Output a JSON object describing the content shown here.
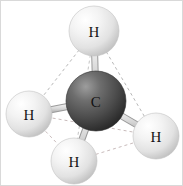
{
  "figure": {
    "background_color": "#ffffff",
    "border_color": "#d9d9d9",
    "width": 183,
    "height": 186
  },
  "molecule": {
    "formula": "CH4",
    "geometry": "tetrahedral",
    "center_atom": {
      "symbol": "C",
      "label": "C",
      "cx": 95,
      "cy": 100,
      "r": 30,
      "color_light": "#8c8c8c",
      "color_mid": "#545454",
      "color_dark": "#2e2e2e",
      "label_color": "#111111"
    },
    "hydrogen_atoms": [
      {
        "id": "h-top",
        "symbol": "H",
        "label": "H",
        "cx": 93,
        "cy": 30,
        "r": 25,
        "color_light": "#ffffff",
        "color_mid": "#ebebeb",
        "color_dark": "#c2c2c2",
        "label_color": "#141414"
      },
      {
        "id": "h-left",
        "symbol": "H",
        "label": "H",
        "cx": 28,
        "cy": 113,
        "r": 23,
        "color_light": "#ffffff",
        "color_mid": "#ebebeb",
        "color_dark": "#c2c2c2",
        "label_color": "#141414"
      },
      {
        "id": "h-right",
        "symbol": "H",
        "label": "H",
        "cx": 155,
        "cy": 135,
        "r": 23,
        "color_light": "#ffffff",
        "color_mid": "#ebebeb",
        "color_dark": "#c2c2c2",
        "label_color": "#141414"
      },
      {
        "id": "h-bottom",
        "symbol": "H",
        "label": "H",
        "cx": 73,
        "cy": 160,
        "r": 23,
        "color_light": "#ffffff",
        "color_mid": "#ebebeb",
        "color_dark": "#c2c2c2",
        "label_color": "#141414"
      }
    ],
    "bonds": [
      {
        "id": "bond-c-h-top",
        "from": "C",
        "to": "h-top",
        "x1": 95,
        "y1": 100,
        "x2": 93,
        "y2": 30,
        "color": "#d0d0d0",
        "edge_color": "#9a9a9a",
        "width": 7
      },
      {
        "id": "bond-c-h-left",
        "from": "C",
        "to": "h-left",
        "x1": 95,
        "y1": 100,
        "x2": 28,
        "y2": 113,
        "color": "#d0d0d0",
        "edge_color": "#9a9a9a",
        "width": 7
      },
      {
        "id": "bond-c-h-right",
        "from": "C",
        "to": "h-right",
        "x1": 95,
        "y1": 100,
        "x2": 155,
        "y2": 135,
        "color": "#d0d0d0",
        "edge_color": "#9a9a9a",
        "width": 7
      },
      {
        "id": "bond-c-h-bottom",
        "from": "C",
        "to": "h-bottom",
        "x1": 95,
        "y1": 100,
        "x2": 73,
        "y2": 160,
        "color": "#d0d0d0",
        "edge_color": "#9a9a9a",
        "width": 7
      }
    ],
    "tetrahedron_edges": [
      {
        "id": "edge-top-left",
        "from": "h-top",
        "to": "h-left",
        "x1": 93,
        "y1": 30,
        "x2": 28,
        "y2": 113,
        "color": "#b8b8b8"
      },
      {
        "id": "edge-top-right",
        "from": "h-top",
        "to": "h-right",
        "x1": 93,
        "y1": 30,
        "x2": 155,
        "y2": 135,
        "color": "#b8b8b8"
      },
      {
        "id": "edge-top-bottom",
        "from": "h-top",
        "to": "h-bottom",
        "x1": 93,
        "y1": 30,
        "x2": 73,
        "y2": 160,
        "color": "#c4c4c4"
      },
      {
        "id": "edge-left-right",
        "from": "h-left",
        "to": "h-right",
        "x1": 28,
        "y1": 113,
        "x2": 155,
        "y2": 135,
        "color": "#c9bcbc"
      },
      {
        "id": "edge-left-bottom",
        "from": "h-left",
        "to": "h-bottom",
        "x1": 28,
        "y1": 113,
        "x2": 73,
        "y2": 160,
        "color": "#c9bcbc"
      },
      {
        "id": "edge-right-bottom",
        "from": "h-right",
        "to": "h-bottom",
        "x1": 155,
        "y1": 135,
        "x2": 73,
        "y2": 160,
        "color": "#c9bcbc"
      }
    ],
    "dash_pattern": "3 3",
    "dash_width": 1
  }
}
